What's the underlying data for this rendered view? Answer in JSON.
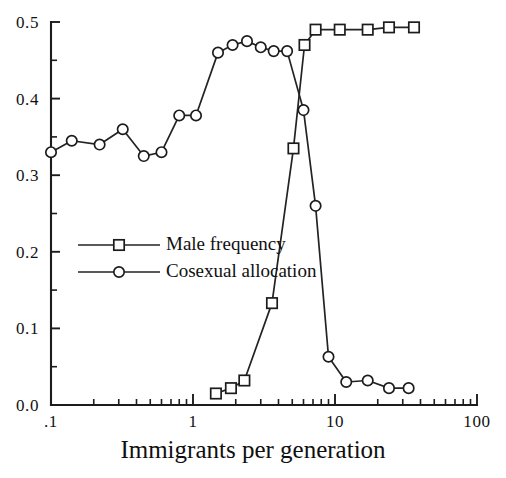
{
  "chart_data": {
    "type": "line",
    "title": "",
    "xlabel": "Immigrants per generation",
    "ylabel": "",
    "xscale": "log",
    "xlim": [
      0.1,
      100
    ],
    "ylim": [
      0.0,
      0.5
    ],
    "grid": false,
    "legend_position": "center-left",
    "x_tick_labels": [
      ".1",
      "1",
      "10",
      "100"
    ],
    "x_tick_values": [
      0.1,
      1,
      10,
      100
    ],
    "y_tick_labels": [
      "0.0",
      "0.1",
      "0.2",
      "0.3",
      "0.4",
      "0.5"
    ],
    "y_tick_values": [
      0.0,
      0.1,
      0.2,
      0.3,
      0.4,
      0.5
    ],
    "y_minor_tick_values": [
      0.05,
      0.15,
      0.25,
      0.35,
      0.45
    ],
    "series": [
      {
        "name": "Male frequency",
        "marker": "square",
        "x": [
          1.45,
          1.85,
          2.3,
          3.6,
          5.1,
          6.1,
          7.3,
          10.8,
          17.0,
          24.0,
          36.0
        ],
        "y": [
          0.015,
          0.022,
          0.032,
          0.133,
          0.335,
          0.47,
          0.49,
          0.49,
          0.49,
          0.493,
          0.493
        ]
      },
      {
        "name": "Cosexual allocation",
        "marker": "circle",
        "x": [
          0.1,
          0.14,
          0.22,
          0.32,
          0.45,
          0.6,
          0.8,
          1.05,
          1.5,
          1.9,
          2.4,
          3.0,
          3.7,
          4.6,
          6.0,
          7.3,
          9.0,
          12.0,
          17.0,
          24.0,
          33.0
        ],
        "y": [
          0.33,
          0.345,
          0.34,
          0.36,
          0.325,
          0.33,
          0.378,
          0.378,
          0.46,
          0.47,
          0.475,
          0.467,
          0.462,
          0.462,
          0.385,
          0.26,
          0.063,
          0.03,
          0.032,
          0.022,
          0.022
        ]
      }
    ]
  },
  "legend": {
    "items": [
      {
        "label": "Male frequency",
        "marker": "square"
      },
      {
        "label": "Cosexual allocation",
        "marker": "circle"
      }
    ]
  },
  "axis_title": "Immigrants per generation"
}
